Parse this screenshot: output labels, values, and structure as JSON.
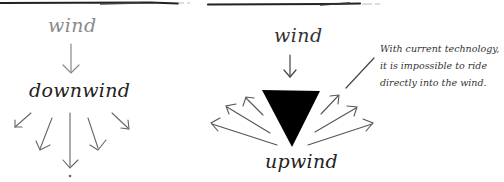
{
  "left_panel": {
    "wind_label": "wind",
    "result_label": "downwind",
    "arrow_count": 5
  },
  "right_panel": {
    "wind_label": "wind",
    "result_label": "upwind",
    "arrow_count": 6,
    "annotation": {
      "lines": [
        "With current technology,",
        "it is impossible to ride",
        "directly into the wind."
      ]
    }
  },
  "colors": {
    "ink": "#222222",
    "light_ink": "#8a8a8a",
    "triangle": "#000000",
    "background": "#ffffff"
  }
}
